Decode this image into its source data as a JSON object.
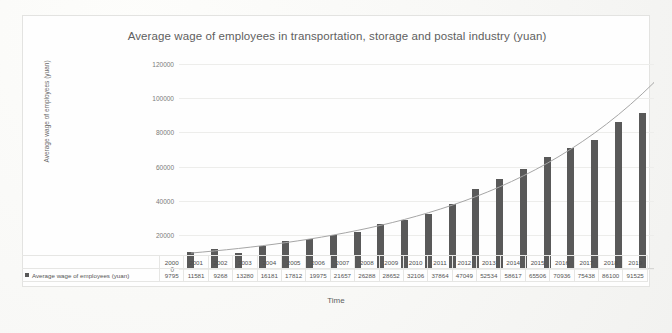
{
  "chart_data": {
    "type": "bar",
    "title": "Average wage of employees in transportation, storage and postal industry (yuan)",
    "xlabel": "Time",
    "ylabel": "Average wage of employees (yuan)",
    "categories": [
      "2000",
      "2001",
      "2002",
      "2003",
      "2004",
      "2005",
      "2006",
      "2007",
      "2008",
      "2009",
      "2010",
      "2011",
      "2012",
      "2013",
      "2014",
      "2015",
      "2016",
      "2017",
      "2018",
      "2019"
    ],
    "series": [
      {
        "name": "Average wage of employees (yuan)",
        "values": [
          9795,
          11581,
          9268,
          13280,
          16181,
          17812,
          19975,
          21657,
          26288,
          28652,
          32106,
          37864,
          47049,
          52534,
          58617,
          65506,
          70936,
          75438,
          86100,
          91525
        ]
      }
    ],
    "ylim": [
      0,
      120000
    ],
    "yticks": [
      "0",
      "20000",
      "40000",
      "60000",
      "80000",
      "100000",
      "120000"
    ],
    "grid": true,
    "legend_position": "bottom-left",
    "trendline": true,
    "bar_color": "#595959",
    "trendline_color": "#a6a6a6",
    "data_table_visible": true
  },
  "legend": {
    "marker_color": "#595959",
    "label": "Average wage of employees (yuan)"
  }
}
